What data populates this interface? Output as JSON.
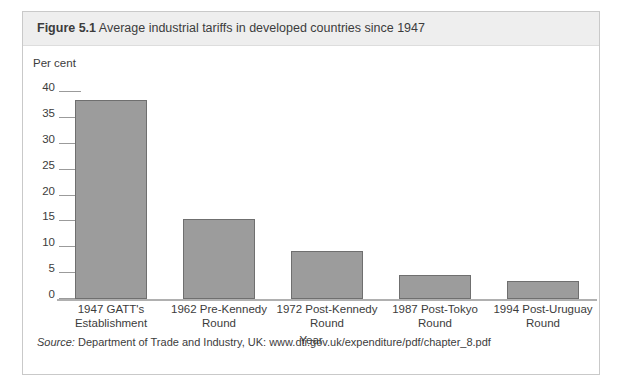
{
  "figure": {
    "label": "Figure 5.1",
    "caption": "Average industrial tariffs in developed countries since 1947",
    "source_word": "Source:",
    "source_text": " Department of Trade and Industry, UK: www.dti.gov.uk/expenditure/pdf/chapter_8.pdf"
  },
  "chart_data": {
    "type": "bar",
    "title": "Average industrial tariffs in developed countries since 1947",
    "xlabel": "Year",
    "ylabel": "Per cent",
    "ylim": [
      0,
      40
    ],
    "ytick_step": 5,
    "yticks": [
      40,
      35,
      30,
      25,
      20,
      15,
      10,
      5,
      0
    ],
    "grid": false,
    "legend": false,
    "bar_color": "#9c9c9c",
    "bar_edge_color": "#6f6f6f",
    "categories": [
      "1947 GATT's Establishment",
      "1962 Pre-Kennedy Round",
      "1972 Post-Kennedy Round",
      "1987 Post-Tokyo Round",
      "1994 Post-Uruguay Round"
    ],
    "category_lines": [
      [
        "1947 GATT's",
        "Establishment"
      ],
      [
        "1962 Pre-Kennedy",
        "Round"
      ],
      [
        "1972 Post-Kennedy",
        "Round"
      ],
      [
        "1987 Post-Tokyo",
        "Round"
      ],
      [
        "1994 Post-Uruguay",
        "Round"
      ]
    ],
    "values": [
      38.5,
      15.5,
      9.3,
      4.7,
      3.5
    ]
  }
}
